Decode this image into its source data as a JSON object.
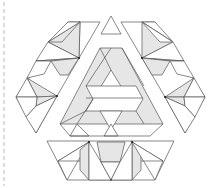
{
  "figure": {
    "colors": {
      "line": "#555555",
      "shade": "#e6e6e6",
      "background": "#ffffff",
      "divider": "#aaaaaa"
    }
  }
}
